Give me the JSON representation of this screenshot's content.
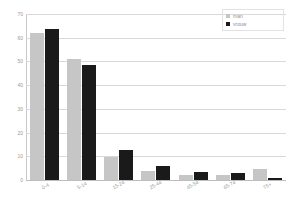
{
  "chart_data": {
    "type": "bar",
    "title": "",
    "xlabel": "",
    "ylabel": "",
    "ylim": [
      0,
      70
    ],
    "ytick_step": 10,
    "yticks": [
      70,
      60,
      50,
      40,
      30,
      20,
      10,
      0
    ],
    "grid": true,
    "legend_position": "top-right",
    "categories": [
      "0-4",
      "5-14",
      "15-24",
      "25-44",
      "45-54",
      "65-74",
      "75+"
    ],
    "series": [
      {
        "name": "man",
        "color": "#c6c6c6",
        "values": [
          62,
          51,
          9.5,
          4,
          2.3,
          2.2,
          4.5
        ]
      },
      {
        "name": "vrouw",
        "color": "#1a1a1a",
        "values": [
          63.5,
          48.5,
          12.5,
          6,
          3.5,
          3,
          1
        ]
      }
    ]
  },
  "legend": {
    "items": [
      {
        "label": "man",
        "swatch": "man-swatch"
      },
      {
        "label": "vrouw",
        "swatch": "vrouw-swatch"
      }
    ]
  }
}
